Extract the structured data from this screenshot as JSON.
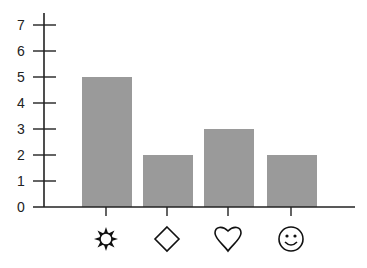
{
  "chart_data": {
    "type": "bar",
    "title": "",
    "xlabel": "",
    "ylabel": "",
    "categories": [
      "sun",
      "diamond",
      "heart",
      "smiley"
    ],
    "category_icons": [
      "sun-icon",
      "diamond-icon",
      "heart-icon",
      "smiley-icon"
    ],
    "values": [
      5,
      2,
      3,
      2
    ],
    "ylim": [
      0,
      7
    ],
    "yticks": [
      "0",
      "1",
      "2",
      "3",
      "4",
      "5",
      "6",
      "7"
    ],
    "grid": false,
    "legend": null,
    "bar_color": "#9a9a9a",
    "axis_color": "#222222"
  }
}
